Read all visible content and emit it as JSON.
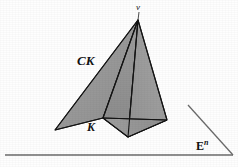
{
  "figure": {
    "type": "geometric-diagram",
    "background_color": "#fefefe",
    "fill_color": "#9a9a9a",
    "stroke_color": "#1a1a1a",
    "baseline_color": "#6b6b6b",
    "labels": {
      "apex": "v",
      "cone": "CK",
      "base": "K",
      "space": "E",
      "space_superscript": "n"
    },
    "geometry": {
      "apex": [
        138,
        20
      ],
      "left_wing_tip": [
        55,
        130
      ],
      "k_vertex": [
        103,
        118
      ],
      "bottom_vertex": [
        128,
        137
      ],
      "right_vertex": [
        167,
        120
      ],
      "baseline": {
        "x1": 5,
        "y1": 155,
        "x2": 233,
        "y2": 155
      },
      "ray": {
        "x1": 188,
        "y1": 105,
        "x2": 233,
        "y2": 155
      }
    }
  }
}
